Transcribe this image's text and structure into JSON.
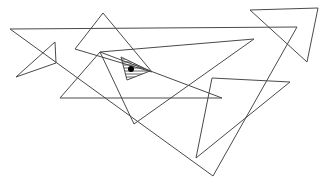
{
  "diagram": {
    "stroke_color": "#4a4a4a",
    "hatch_color": "#3a3a3a",
    "dot_color": "#000000",
    "background": "#ffffff",
    "triangles": [
      {
        "id": "top-right",
        "points": [
          [
            250,
            10
          ],
          [
            318,
            8
          ],
          [
            307,
            62
          ]
        ]
      },
      {
        "id": "large-main",
        "points": [
          [
            10,
            29
          ],
          [
            297,
            27
          ],
          [
            213,
            176
          ]
        ]
      },
      {
        "id": "small-left",
        "points": [
          [
            55,
            42
          ],
          [
            16,
            77
          ],
          [
            56,
            63
          ]
        ]
      },
      {
        "id": "top-middle",
        "points": [
          [
            103,
            13
          ],
          [
            75,
            49
          ],
          [
            152,
            72
          ]
        ]
      },
      {
        "id": "long-wedge",
        "points": [
          [
            254,
            39
          ],
          [
            100,
            52
          ],
          [
            134,
            124
          ]
        ]
      },
      {
        "id": "lower-left",
        "points": [
          [
            100,
            52
          ],
          [
            60,
            98
          ],
          [
            222,
            98
          ]
        ]
      },
      {
        "id": "right-wedge",
        "points": [
          [
            212,
            78
          ],
          [
            290,
            82
          ],
          [
            196,
            158
          ]
        ]
      }
    ],
    "shaded_triangle": {
      "points": [
        [
          121,
          57
        ],
        [
          127,
          80
        ],
        [
          150,
          71
        ]
      ]
    },
    "dot": {
      "cx": 131,
      "cy": 69,
      "r": 3
    }
  }
}
